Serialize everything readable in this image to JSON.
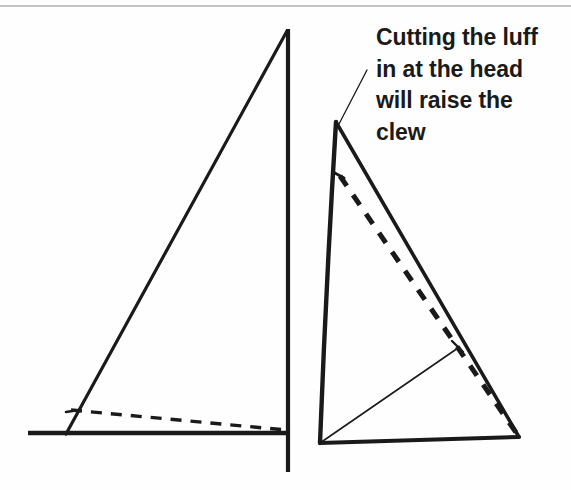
{
  "figure": {
    "domain": "Diagram",
    "background_color": "#fefefe",
    "ink_color": "#1a1a1a",
    "rule_color": "#8a8a8a",
    "annotation": {
      "name": "callout-text",
      "lines": [
        "Cutting the luff",
        "in at the head",
        "will raise the",
        "clew"
      ],
      "full_text": "Cutting the luff in at the head will raise the clew",
      "font_size_px": 23,
      "font_weight": "bold",
      "color": "#1a1a1a",
      "leader_line": {
        "from": [
          367,
          70
        ],
        "to": [
          339,
          124
        ]
      }
    },
    "top_rule": {
      "name": "page-rule",
      "y": 6,
      "x1": 0,
      "x2": 571,
      "color": "#8a8a8a",
      "width": 1.2
    },
    "left_diagram": {
      "name": "standard-sail-plan",
      "caption": "",
      "mast": {
        "name": "mast-line",
        "x": 288,
        "y_top": 29,
        "y_bottom": 472,
        "stroke_width": 4.2
      },
      "boom": {
        "name": "boom-line",
        "x1": 28,
        "x2": 288,
        "y": 433,
        "stroke_width": 4.6
      },
      "luff": {
        "name": "luff-line",
        "from": [
          66,
          434
        ],
        "to": [
          287,
          31
        ],
        "stroke_width": 3.2
      },
      "dashed_cut": {
        "name": "raised-foot-dashed-line",
        "from": [
          71,
          410
        ],
        "to": [
          286,
          430
        ],
        "stroke_width": 3.4,
        "dash": "11 9"
      },
      "tick": {
        "name": "luff-tick-mark",
        "from": [
          66,
          412
        ],
        "to": [
          79,
          410
        ]
      }
    },
    "right_diagram": {
      "name": "cut-luff-sail-plan",
      "head": [
        336,
        122
      ],
      "tack": [
        320,
        443
      ],
      "clew": [
        519,
        437
      ],
      "luff": {
        "name": "curved-luff",
        "description": "luff bows slightly to the left between head and tack",
        "control": [
          326,
          285
        ],
        "stroke_width": 4.4
      },
      "leech": {
        "name": "leech-line",
        "from": [
          336,
          122
        ],
        "to": [
          519,
          437
        ],
        "stroke_width": 3.6
      },
      "foot": {
        "name": "foot-line",
        "from": [
          320,
          443
        ],
        "to": [
          519,
          437
        ],
        "stroke_width": 4.0
      },
      "dashed_cut": {
        "name": "new-leech-dashed-line",
        "from": [
          340,
          176
        ],
        "to": [
          517,
          434
        ],
        "stroke_width": 5.0,
        "dash": "12 11"
      },
      "diagonal": {
        "name": "tack-to-leech-diagonal",
        "from": [
          320,
          443
        ],
        "to": [
          458,
          348
        ],
        "stroke_width": 1.6
      },
      "tick": {
        "name": "leech-tick-mark",
        "from": [
          452,
          341
        ],
        "to": [
          463,
          352
        ]
      },
      "luff_tick": {
        "name": "luff-dash-start-tick",
        "from": [
          333,
          172
        ],
        "to": [
          344,
          178
        ]
      }
    }
  }
}
